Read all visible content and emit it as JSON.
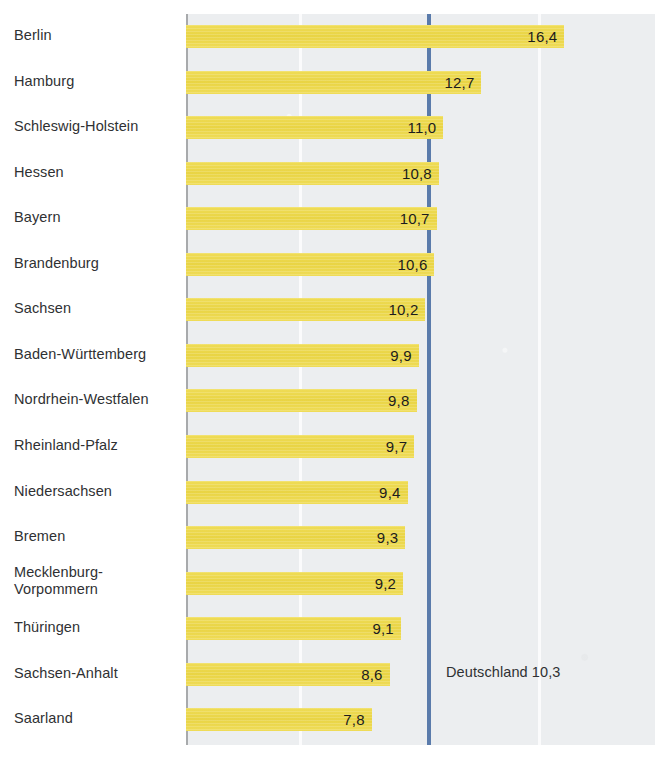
{
  "chart_data": {
    "type": "bar",
    "orientation": "horizontal",
    "title": "",
    "subtitle": "",
    "xlabel": "",
    "ylabel": "",
    "grid": true,
    "legend": "none",
    "axis_note": "value axis is truncated; bars begin at the left axis, not at zero",
    "value_format": "comma-decimal",
    "categories": [
      "Berlin",
      "Hamburg",
      "Schleswig-Holstein",
      "Hessen",
      "Bayern",
      "Brandenburg",
      "Sachsen",
      "Baden-Württemberg",
      "Nordrhein-Westfalen",
      "Rheinland-Pfalz",
      "Niedersachsen",
      "Bremen",
      "Mecklenburg-\nVorpommern",
      "Thüringen",
      "Sachsen-Anhalt",
      "Saarland"
    ],
    "values": [
      16.4,
      12.7,
      11.0,
      10.8,
      10.7,
      10.6,
      10.2,
      9.9,
      9.8,
      9.7,
      9.4,
      9.3,
      9.2,
      9.1,
      8.6,
      7.8
    ],
    "value_labels": [
      "16,4",
      "12,7",
      "11,0",
      "10,8",
      "10,7",
      "10,6",
      "10,2",
      "9,9",
      "9,8",
      "9,7",
      "9,4",
      "9,3",
      "9,2",
      "9,1",
      "8,6",
      "7,8"
    ],
    "reference_line": {
      "label": "Deutschland 10,3",
      "value": 10.3,
      "color": "#5a7bab"
    },
    "colors": {
      "bar": "#ecd94f",
      "plot_background": "#eceef0",
      "gridline": "#fbfbfc",
      "axis": "#a8aaac",
      "label_text": "#2f3133",
      "value_text": "#1c1c1c"
    }
  }
}
